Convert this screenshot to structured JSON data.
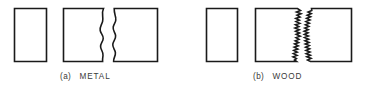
{
  "figure": {
    "type": "line-diagram",
    "background_color": "#ffffff",
    "line_color": "#1a1a1a",
    "text_color": "#3a3a3a",
    "width": 376,
    "height": 89
  },
  "panels": [
    {
      "id": "panel-a",
      "tag": "(a)",
      "label": "METAL",
      "caption": "(a)  METAL",
      "fracture_style": "smooth-wavy",
      "specimens": [
        {
          "name": "intact-specimen",
          "edges": "all-straight",
          "x": 14,
          "y": 8,
          "width": 33,
          "height": 54
        },
        {
          "name": "broken-left-piece",
          "edges": "right-edge-wavy",
          "x": 63,
          "y": 8,
          "width": 43,
          "height": 54
        },
        {
          "name": "broken-right-piece",
          "edges": "left-edge-wavy",
          "x": 112,
          "y": 8,
          "width": 46,
          "height": 54
        }
      ]
    },
    {
      "id": "panel-b",
      "tag": "(b)",
      "label": "WOOD",
      "caption": "(b)  WOOD",
      "fracture_style": "jagged-splintered",
      "specimens": [
        {
          "name": "intact-specimen",
          "edges": "all-straight",
          "x": 206,
          "y": 8,
          "width": 32,
          "height": 54
        },
        {
          "name": "broken-left-piece",
          "edges": "right-edge-jagged",
          "x": 255,
          "y": 8,
          "width": 47,
          "height": 54
        },
        {
          "name": "broken-right-piece",
          "edges": "left-edge-jagged",
          "x": 305,
          "y": 8,
          "width": 47,
          "height": 54
        }
      ]
    }
  ],
  "captions": {
    "metal": {
      "tag": "(a)",
      "label": "METAL",
      "x": 60,
      "y": 79
    },
    "wood": {
      "tag": "(b)",
      "label": "WOOD",
      "x": 253,
      "y": 79
    }
  }
}
